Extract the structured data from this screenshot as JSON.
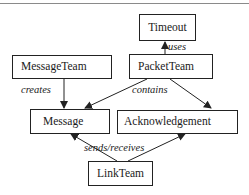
{
  "diagram": {
    "type": "class-relationship",
    "nodes": [
      {
        "id": "timeout",
        "label": "Timeout"
      },
      {
        "id": "message_team",
        "label": "MessageTeam"
      },
      {
        "id": "packet_team",
        "label": "PacketTeam"
      },
      {
        "id": "message",
        "label": "Message"
      },
      {
        "id": "acknowledgement",
        "label": "Acknowledgement"
      },
      {
        "id": "link_team",
        "label": "LinkTeam"
      }
    ],
    "edges": [
      {
        "from": "packet_team",
        "to": "timeout",
        "label": "uses"
      },
      {
        "from": "message_team",
        "to": "message",
        "label": "creates"
      },
      {
        "from": "packet_team",
        "to": "message",
        "label": "contains"
      },
      {
        "from": "packet_team",
        "to": "acknowledgement",
        "label": "contains"
      },
      {
        "from": "link_team",
        "to": "message",
        "label": "sends/receives"
      },
      {
        "from": "link_team",
        "to": "acknowledgement",
        "label": "sends/receives"
      }
    ],
    "edge_labels": {
      "uses": "uses",
      "creates": "creates",
      "contains": "contains",
      "sends_receives": "sends/receives"
    },
    "colors": {
      "line": "#222222",
      "background": "#ffffff"
    }
  }
}
